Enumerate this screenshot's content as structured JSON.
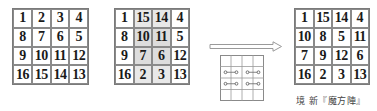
{
  "squares": [
    {
      "id": "original",
      "rows": [
        [
          "1",
          "2",
          "3",
          "4"
        ],
        [
          "8",
          "7",
          "6",
          "5"
        ],
        [
          "9",
          "10",
          "11",
          "12"
        ],
        [
          "16",
          "15",
          "14",
          "13"
        ]
      ],
      "shaded": []
    },
    {
      "id": "middle-columns-swapped",
      "rows": [
        [
          "1",
          "15",
          "14",
          "4"
        ],
        [
          "8",
          "10",
          "11",
          "5"
        ],
        [
          "9",
          "7",
          "6",
          "12"
        ],
        [
          "16",
          "2",
          "3",
          "13"
        ]
      ],
      "shaded_columns": [
        1,
        2
      ],
      "shaded_center": true
    },
    {
      "id": "result",
      "rows": [
        [
          "1",
          "15",
          "14",
          "4"
        ],
        [
          "10",
          "8",
          "5",
          "11"
        ],
        [
          "7",
          "9",
          "12",
          "6"
        ],
        [
          "16",
          "2",
          "3",
          "13"
        ]
      ],
      "shaded": []
    }
  ],
  "arrow": {
    "icon": "hollow-right-arrow-icon"
  },
  "swap_diagram": {
    "size": "4x4",
    "links": [
      {
        "row": 1,
        "from_col": 0,
        "to_col": 1
      },
      {
        "row": 1,
        "from_col": 2,
        "to_col": 3
      },
      {
        "row": 2,
        "from_col": 0,
        "to_col": 1
      },
      {
        "row": 2,
        "from_col": 2,
        "to_col": 3
      }
    ]
  },
  "caption": "境 新『魔方陣』",
  "colors": {
    "grid_line": "#8a8a8a",
    "shade": "#e8e8e8",
    "shade_center": "#dddddd",
    "text": "#1a1a1a"
  }
}
